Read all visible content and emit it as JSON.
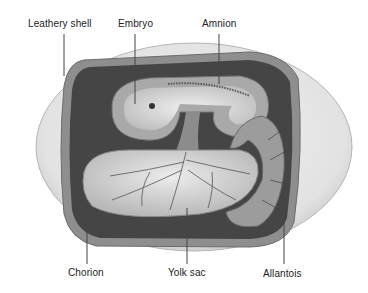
{
  "diagram": {
    "colors": {
      "shell": "#e4e4e4",
      "shell_edge": "#b8b8b8",
      "chorion_cavity": "#4a4a4a",
      "membrane": "#9a9a9a",
      "yolk": "#d6d6d6",
      "vessels": "#555555",
      "leader_line": "#444444",
      "text": "#222222"
    },
    "labels": {
      "leathery_shell": "Leathery shell",
      "embryo": "Embryo",
      "amnion": "Amnion",
      "chorion": "Chorion",
      "yolk_sac": "Yolk sac",
      "allantois": "Allantois"
    }
  }
}
